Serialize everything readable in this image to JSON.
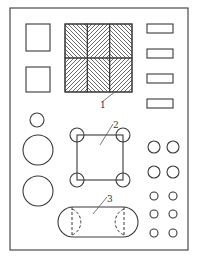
{
  "diagram": {
    "type": "mechanical-part-layout",
    "colors": {
      "line": "#3a3a3a",
      "background": "#ffffff",
      "hatch": "#444444"
    },
    "outer_border": {
      "x": 10,
      "y": 8,
      "w": 178,
      "h": 242
    },
    "left_squares": [
      {
        "x": 26,
        "y": 24,
        "w": 24,
        "h": 27
      },
      {
        "x": 26,
        "y": 67,
        "w": 24,
        "h": 25
      }
    ],
    "hatched_grid": {
      "x": 65,
      "y": 24,
      "w": 67,
      "h": 68,
      "cols": 3,
      "rows": 2,
      "pattern": [
        [
          "backslash",
          "slash",
          "backslash"
        ],
        [
          "slash",
          "backslash",
          "slash"
        ]
      ]
    },
    "right_rects": [
      {
        "x": 147,
        "y": 24,
        "w": 26,
        "h": 9
      },
      {
        "x": 147,
        "y": 49,
        "w": 26,
        "h": 9
      },
      {
        "x": 147,
        "y": 74,
        "w": 26,
        "h": 9
      },
      {
        "x": 147,
        "y": 99,
        "w": 26,
        "h": 9
      }
    ],
    "left_circles": [
      {
        "cx": 37,
        "cy": 120,
        "r": 7
      },
      {
        "cx": 38,
        "cy": 150,
        "r": 15
      },
      {
        "cx": 38,
        "cy": 191,
        "r": 15
      }
    ],
    "square_with_corner_circles": {
      "x": 77,
      "y": 135,
      "w": 46,
      "h": 45,
      "corner_r": 7
    },
    "slot": {
      "x": 58,
      "y": 207,
      "w": 80,
      "h": 30,
      "dashed_circles": [
        {
          "cx": 72,
          "cy": 222,
          "r": 14
        },
        {
          "cx": 124,
          "cy": 222,
          "r": 14
        }
      ]
    },
    "right_circles": [
      {
        "cx": 154,
        "cy": 147,
        "r": 6
      },
      {
        "cx": 173,
        "cy": 147,
        "r": 6
      },
      {
        "cx": 154,
        "cy": 172,
        "r": 6
      },
      {
        "cx": 173,
        "cy": 172,
        "r": 6
      },
      {
        "cx": 154,
        "cy": 196,
        "r": 4
      },
      {
        "cx": 173,
        "cy": 196,
        "r": 4
      },
      {
        "cx": 154,
        "cy": 214,
        "r": 4
      },
      {
        "cx": 173,
        "cy": 214,
        "r": 4
      },
      {
        "cx": 154,
        "cy": 233,
        "r": 4
      },
      {
        "cx": 173,
        "cy": 233,
        "r": 4
      }
    ],
    "callouts": [
      {
        "label": "1",
        "text_x": 100,
        "text_y": 108,
        "line": [
          102,
          102,
          116,
          91
        ]
      },
      {
        "label": "2",
        "text_x": 113,
        "text_y": 128,
        "line": [
          113,
          124,
          100,
          145
        ]
      },
      {
        "label": "3",
        "text_x": 107,
        "text_y": 202,
        "line": [
          107,
          197,
          93,
          214
        ]
      }
    ]
  }
}
